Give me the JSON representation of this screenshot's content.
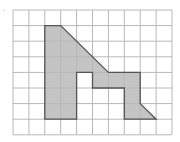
{
  "diagram": {
    "type": "grid-polygon",
    "mark": "·",
    "grid": {
      "cols": 10,
      "rows": 8,
      "origin_x": 13,
      "origin_y": 10,
      "cell_w": 15.9,
      "cell_h": 15.6,
      "line_color": "#b8b8b8"
    },
    "polygon": {
      "fill": "#c4c4c4",
      "stroke": "#555555",
      "vertices": [
        [
          2,
          1
        ],
        [
          3,
          1
        ],
        [
          6,
          4
        ],
        [
          8,
          4
        ],
        [
          8,
          6
        ],
        [
          9,
          7
        ],
        [
          7,
          7
        ],
        [
          7,
          5
        ],
        [
          5,
          5
        ],
        [
          5,
          4
        ],
        [
          4,
          4
        ],
        [
          4,
          7
        ],
        [
          2,
          7
        ]
      ]
    }
  }
}
